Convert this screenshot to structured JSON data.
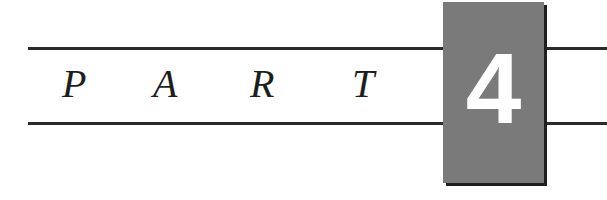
{
  "part_header": {
    "letters": [
      "P",
      "A",
      "R",
      "T"
    ],
    "number": "4",
    "colors": {
      "rule": "#2a2a2a",
      "box": "#7a7a7a",
      "box_shadow": "#1f1f1f",
      "number": "#ffffff",
      "letters": "#1e1e1e"
    }
  }
}
